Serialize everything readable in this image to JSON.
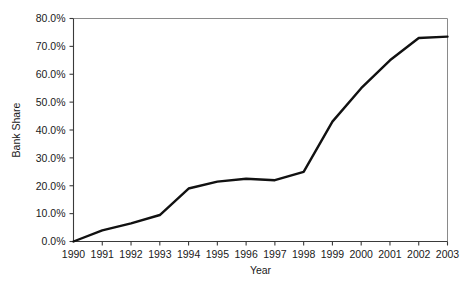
{
  "chart_data": {
    "type": "line",
    "title": "",
    "xlabel": "Year",
    "ylabel": "Bank Share",
    "x": [
      1990,
      1991,
      1992,
      1993,
      1994,
      1995,
      1996,
      1997,
      1998,
      1999,
      2000,
      2001,
      2002,
      2003
    ],
    "categories": [
      "1990",
      "1991",
      "1992",
      "1993",
      "1994",
      "1995",
      "1996",
      "1997",
      "1998",
      "1999",
      "2000",
      "2001",
      "2002",
      "2003"
    ],
    "values": [
      0.0,
      4.0,
      6.5,
      9.5,
      19.0,
      21.5,
      22.5,
      22.0,
      25.0,
      43.0,
      55.0,
      65.0,
      73.0,
      73.5
    ],
    "series": [
      {
        "name": "Bank Share",
        "values": [
          0.0,
          4.0,
          6.5,
          9.5,
          19.0,
          21.5,
          22.5,
          22.0,
          25.0,
          43.0,
          55.0,
          65.0,
          73.0,
          73.5
        ],
        "color": "#111111"
      }
    ],
    "ylim": [
      0,
      80
    ],
    "xlim": [
      1990,
      2003
    ],
    "ytick_values": [
      0,
      10,
      20,
      30,
      40,
      50,
      60,
      70,
      80
    ],
    "ytick_labels": [
      "0.0%",
      "10.0%",
      "20.0%",
      "30.0%",
      "40.0%",
      "50.0%",
      "60.0%",
      "70.0%",
      "80.0%"
    ],
    "xtick_labels": [
      "1990",
      "1991",
      "1992",
      "1993",
      "1994",
      "1995",
      "1996",
      "1997",
      "1998",
      "1999",
      "2000",
      "2001",
      "2002",
      "2003"
    ],
    "grid": false,
    "legend": null,
    "legend_position": "none",
    "annotations": []
  }
}
